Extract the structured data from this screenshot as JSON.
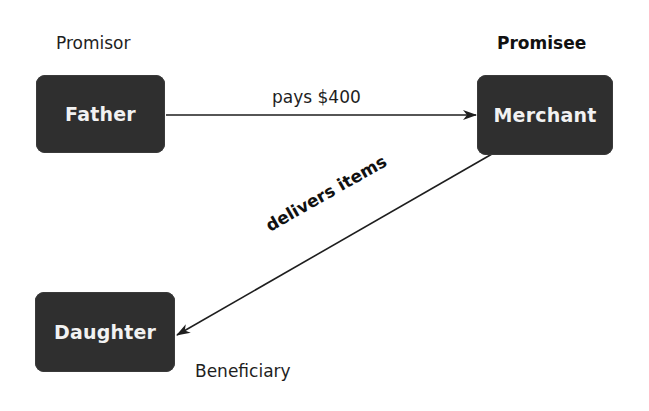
{
  "diagram": {
    "type": "contract-relationship",
    "nodes": [
      {
        "id": "father",
        "label": "Father",
        "role": "Promisor"
      },
      {
        "id": "merchant",
        "label": "Merchant",
        "role": "Promisee"
      },
      {
        "id": "daughter",
        "label": "Daughter",
        "role": "Beneficiary"
      }
    ],
    "edges": [
      {
        "from": "father",
        "to": "merchant",
        "label": "pays $400"
      },
      {
        "from": "merchant",
        "to": "daughter",
        "label": "delivers items"
      }
    ],
    "colors": {
      "node_fill": "#2f2f2f",
      "node_text": "#f2f2f2",
      "edge": "#1e1e1e",
      "background": "#ffffff"
    }
  }
}
